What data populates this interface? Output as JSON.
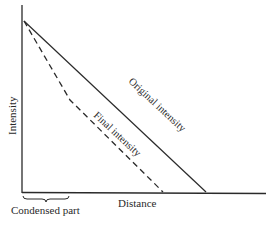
{
  "diagram": {
    "axes": {
      "y_label": "Intensity",
      "x_label": "Distance"
    },
    "curves": [
      {
        "name": "Original intensity",
        "style": "solid",
        "points": [
          [
            24,
            21
          ],
          [
            206,
            192
          ]
        ]
      },
      {
        "name": "Final intensity",
        "style": "dashed",
        "points": [
          [
            24,
            21
          ],
          [
            70,
            100
          ],
          [
            163,
            192
          ]
        ]
      }
    ],
    "annotations": {
      "brace_label": "Condensed part"
    },
    "colors": {
      "line": "#2a2a2a",
      "background": "#ffffff"
    }
  }
}
